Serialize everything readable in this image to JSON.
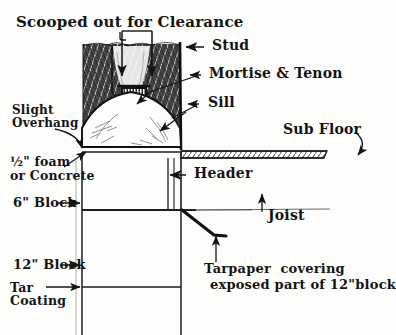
{
  "figure": {
    "kind": "hand-drawn architectural cross-section",
    "ink_color": "#141414",
    "paper_color": "#fdfdfb"
  },
  "labels": {
    "title": "Scooped out for Clearance",
    "stud": "Stud",
    "mortise_tenon": "Mortise & Tenon",
    "sill": "Sill",
    "slight_overhang_l1": "Slight",
    "slight_overhang_l2": "Overhang",
    "foam_l1": "½\" foam",
    "foam_l2": "or Concrete",
    "block6": "6\" Block",
    "block12": "12\" Block",
    "tar_l1": "Tar",
    "tar_l2": "Coating",
    "sub_floor": "Sub Floor",
    "header": "Header",
    "joist": "Joist",
    "tarpaper_l1": "Tarpaper  covering",
    "tarpaper_l2": "exposed part of 12\"block"
  },
  "icons": {
    "arrow_down_scoop_left": "arrow-down-icon",
    "arrow_down_scoop_right": "arrow-down-icon",
    "arrow_left_stud": "arrow-left-icon",
    "arrow_left_mortise": "arrow-left-icon",
    "arrow_down_mortise": "arrow-down-icon",
    "arrow_left_sill": "arrow-left-icon",
    "arrow_overhang": "curved-arrow-icon",
    "arrow_foam": "arrow-up-right-icon",
    "arrow_block6": "arrow-right-icon",
    "arrow_block12": "arrow-right-icon",
    "arrow_tar": "arrow-right-icon",
    "arrow_subfloor": "curved-arrow-icon",
    "arrow_header": "arrow-left-icon",
    "arrow_joist": "arrow-up-icon",
    "arrow_tarpaper": "arrow-up-icon"
  },
  "parts": {
    "stud_hatching": "dense cross-hatched sawn wood of studs",
    "sill_arch": "light domed arch with faint wood grain",
    "sub_floor_strip": "diagonally hatched thin board",
    "header_double_line": "two close vertical lines",
    "wall_6in": "6 inch block wall course",
    "wall_12in": "12 inch block wall course",
    "tarpaper_line": "thick sloping line over ledge"
  }
}
